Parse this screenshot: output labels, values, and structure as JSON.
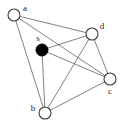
{
  "figure": {
    "kind": "undirected-graph-diagram",
    "width": 124,
    "height": 124,
    "background_color": "#ffffff",
    "edge_color": "#4a4a4a",
    "node_stroke_color": "#3d3d3d",
    "node_fill_color": "#ffffff",
    "highlight_fill_color": "#000000",
    "label_color": "#1a1a1a"
  },
  "chart_data": {
    "type": "scatter",
    "title": "",
    "xlabel": "",
    "ylabel": "",
    "xlim": [
      0,
      124
    ],
    "ylim": [
      0,
      124
    ],
    "grid": false,
    "legend": "none",
    "nodes": [
      {
        "id": "a",
        "label": "a",
        "x": 14,
        "y": 15,
        "r": 6,
        "style": "open",
        "label_x": 25,
        "label_y": 9
      },
      {
        "id": "s",
        "label": "s",
        "x": 42,
        "y": 50,
        "r": 6,
        "style": "filled",
        "label_x": 38,
        "label_y": 39
      },
      {
        "id": "d",
        "label": "d",
        "x": 92,
        "y": 34,
        "r": 6,
        "style": "open",
        "label_x": 102,
        "label_y": 27
      },
      {
        "id": "c",
        "label": "c",
        "x": 110,
        "y": 79,
        "r": 6,
        "style": "open",
        "label_x": 110,
        "label_y": 92
      },
      {
        "id": "b",
        "label": "b",
        "x": 45,
        "y": 113,
        "r": 6,
        "style": "open",
        "label_x": 33,
        "label_y": 109
      }
    ],
    "edges": [
      {
        "from": "a",
        "to": "d"
      },
      {
        "from": "a",
        "to": "c"
      },
      {
        "from": "a",
        "to": "b"
      },
      {
        "from": "s",
        "to": "d"
      },
      {
        "from": "s",
        "to": "c"
      },
      {
        "from": "s",
        "to": "b"
      },
      {
        "from": "d",
        "to": "b"
      },
      {
        "from": "d",
        "to": "c"
      },
      {
        "from": "b",
        "to": "c"
      }
    ],
    "node_count": 5,
    "edge_count": 9
  }
}
